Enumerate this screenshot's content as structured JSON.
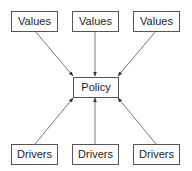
{
  "diagram": {
    "type": "flow",
    "center": {
      "label": "Policy"
    },
    "top_nodes": [
      {
        "label": "Values"
      },
      {
        "label": "Values"
      },
      {
        "label": "Values"
      }
    ],
    "bottom_nodes": [
      {
        "label": "Drivers"
      },
      {
        "label": "Drivers"
      },
      {
        "label": "Drivers"
      }
    ],
    "edges": [
      {
        "from": "Values (left)",
        "to": "Policy"
      },
      {
        "from": "Values (center)",
        "to": "Policy"
      },
      {
        "from": "Values (right)",
        "to": "Policy"
      },
      {
        "from": "Drivers (left)",
        "to": "Policy"
      },
      {
        "from": "Drivers (center)",
        "to": "Policy"
      },
      {
        "from": "Drivers (right)",
        "to": "Policy"
      }
    ],
    "colors": {
      "stroke": "#555555",
      "text": "#222222",
      "background": "#ffffff"
    }
  }
}
